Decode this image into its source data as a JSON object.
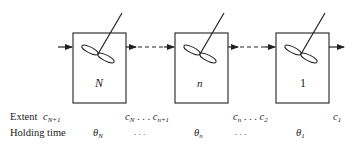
{
  "diagram": {
    "type": "cascade of stirred tanks",
    "tanks": [
      {
        "label": "N"
      },
      {
        "label": "n"
      },
      {
        "label": "1"
      }
    ],
    "rows": [
      {
        "label": "Extent",
        "entries": [
          {
            "base": "c",
            "sub": "N+1"
          },
          {
            "base": "c",
            "sub": "N",
            "dots": ". . .",
            "base2": "c",
            "sub2": "n+1"
          },
          {
            "base": "c",
            "sub": "n",
            "dots": ". . .",
            "base2": "c",
            "sub2": "2"
          },
          {
            "base": "c",
            "sub": "1"
          }
        ]
      },
      {
        "label": "Holding time",
        "entries": [
          {
            "base": "θ",
            "sub": "N"
          },
          {
            "dots": ".   .   ."
          },
          {
            "base": "θ",
            "sub": "n"
          },
          {
            "dots": ".   .   ."
          },
          {
            "base": "θ",
            "sub": "1"
          }
        ]
      }
    ],
    "colors": {
      "line": "#222222",
      "background": "#ffffff"
    }
  }
}
